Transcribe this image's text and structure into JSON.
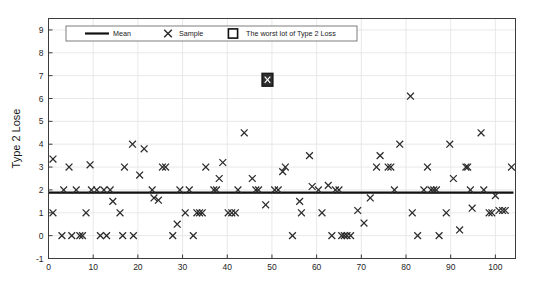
{
  "chart_data": {
    "type": "scatter",
    "title": "",
    "xlabel": "",
    "ylabel": "Type 2 Lose",
    "xlim": [
      0,
      104.5
    ],
    "ylim": [
      -1,
      9.5
    ],
    "xticks": [
      0,
      10,
      20,
      30,
      40,
      50,
      60,
      70,
      80,
      90,
      100
    ],
    "yticks": [
      -1,
      0,
      1,
      2,
      3,
      4,
      5,
      6,
      7,
      8,
      9
    ],
    "grid": true,
    "legend_position": "top-left-inside",
    "legend": [
      {
        "label": "Mean",
        "marker": "line"
      },
      {
        "label": "Sample",
        "marker": "x"
      },
      {
        "label": "The worst lot of Type 2 Loss",
        "marker": "square"
      }
    ],
    "series": [
      {
        "name": "Sample",
        "marker": "x",
        "color": "#2b2b2b",
        "points": [
          [
            1,
            1.0
          ],
          [
            1,
            3.35
          ],
          [
            3,
            0.0
          ],
          [
            3.4,
            2.0
          ],
          [
            4.6,
            3.0
          ],
          [
            5.2,
            0.0
          ],
          [
            6.2,
            2.0
          ],
          [
            7.0,
            0.0
          ],
          [
            7.6,
            0.0
          ],
          [
            8.4,
            1.0
          ],
          [
            9.3,
            3.1
          ],
          [
            9.6,
            2.0
          ],
          [
            10.8,
            2.0
          ],
          [
            11.6,
            0.0
          ],
          [
            12.4,
            2.0
          ],
          [
            13.0,
            0.0
          ],
          [
            13.8,
            2.0
          ],
          [
            14.4,
            1.5
          ],
          [
            16.0,
            1.0
          ],
          [
            16.6,
            0.0
          ],
          [
            17.0,
            3.0
          ],
          [
            18.8,
            4.0
          ],
          [
            19.0,
            0.0
          ],
          [
            20.4,
            2.65
          ],
          [
            21.4,
            3.8
          ],
          [
            23.2,
            2.0
          ],
          [
            23.6,
            1.65
          ],
          [
            24.6,
            1.55
          ],
          [
            25.5,
            3.0
          ],
          [
            26.2,
            3.0
          ],
          [
            27.8,
            0.0
          ],
          [
            28.8,
            0.5
          ],
          [
            29.4,
            2.0
          ],
          [
            30.6,
            1.0
          ],
          [
            31.5,
            2.0
          ],
          [
            32.4,
            0.0
          ],
          [
            33.2,
            1.0
          ],
          [
            33.8,
            1.0
          ],
          [
            34.4,
            1.0
          ],
          [
            35.2,
            3.0
          ],
          [
            37.0,
            2.0
          ],
          [
            37.6,
            2.0
          ],
          [
            38.2,
            2.5
          ],
          [
            39.0,
            3.2
          ],
          [
            40.2,
            1.0
          ],
          [
            41.0,
            1.0
          ],
          [
            41.8,
            1.0
          ],
          [
            42.4,
            2.0
          ],
          [
            43.8,
            4.5
          ],
          [
            45.6,
            2.5
          ],
          [
            46.4,
            2.0
          ],
          [
            47.0,
            2.0
          ],
          [
            48.6,
            1.35
          ],
          [
            50.6,
            2.0
          ],
          [
            51.4,
            2.0
          ],
          [
            52.4,
            2.8
          ],
          [
            53.0,
            3.0
          ],
          [
            54.6,
            0.0
          ],
          [
            56.2,
            1.5
          ],
          [
            56.6,
            1.0
          ],
          [
            58.4,
            3.5
          ],
          [
            59.0,
            2.15
          ],
          [
            60.4,
            2.0
          ],
          [
            61.2,
            1.0
          ],
          [
            62.6,
            2.2
          ],
          [
            63.4,
            0.0
          ],
          [
            64.2,
            2.0
          ],
          [
            65.0,
            2.0
          ],
          [
            65.6,
            0.0
          ],
          [
            66.2,
            0.0
          ],
          [
            66.8,
            0.0
          ],
          [
            67.6,
            0.0
          ],
          [
            69.2,
            1.1
          ],
          [
            70.6,
            0.55
          ],
          [
            72.0,
            1.65
          ],
          [
            73.4,
            3.0
          ],
          [
            74.2,
            3.5
          ],
          [
            76.0,
            3.0
          ],
          [
            76.6,
            3.0
          ],
          [
            77.4,
            2.0
          ],
          [
            78.6,
            4.0
          ],
          [
            81.0,
            6.1
          ],
          [
            81.4,
            1.0
          ],
          [
            82.6,
            0.0
          ],
          [
            84.0,
            2.0
          ],
          [
            84.8,
            3.0
          ],
          [
            85.6,
            2.0
          ],
          [
            86.2,
            2.0
          ],
          [
            86.8,
            2.0
          ],
          [
            87.4,
            0.0
          ],
          [
            89.0,
            1.0
          ],
          [
            89.8,
            4.0
          ],
          [
            90.6,
            2.5
          ],
          [
            92.0,
            0.25
          ],
          [
            93.4,
            3.0
          ],
          [
            93.8,
            3.0
          ],
          [
            94.4,
            2.0
          ],
          [
            94.8,
            1.2
          ],
          [
            96.8,
            4.5
          ],
          [
            97.4,
            2.0
          ],
          [
            98.6,
            1.0
          ],
          [
            99.2,
            1.0
          ],
          [
            100.0,
            1.75
          ],
          [
            100.8,
            1.1
          ],
          [
            101.6,
            1.1
          ],
          [
            102.2,
            1.1
          ],
          [
            103.6,
            3.0
          ]
        ]
      }
    ],
    "mean_line": {
      "value": 1.88,
      "label": "Mean",
      "color": "#111111"
    },
    "worst_lot": {
      "x": 49.0,
      "y": 6.82,
      "label": "The worst lot of Type 2 Loss"
    }
  }
}
